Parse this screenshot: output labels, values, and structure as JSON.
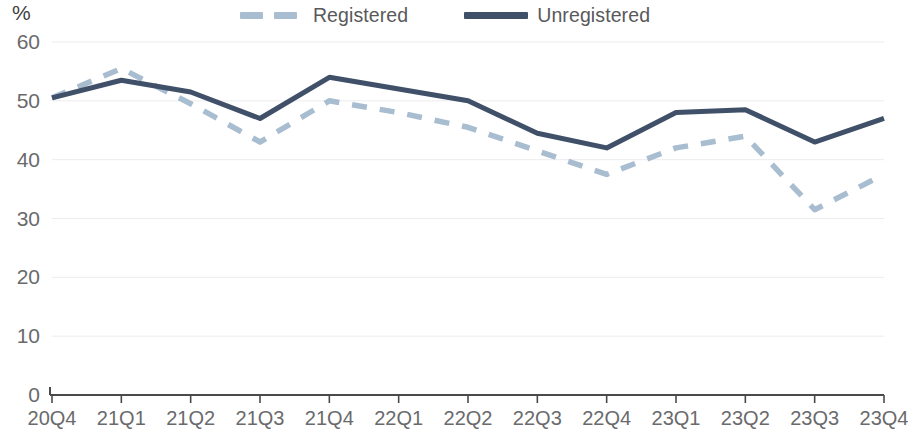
{
  "legend": {
    "entries": [
      {
        "label": "Registered",
        "style": "dashed",
        "color": "#a8bdd0"
      },
      {
        "label": "Unregistered",
        "style": "solid",
        "color": "#3f5068"
      }
    ]
  },
  "axes": {
    "y_unit": "%",
    "y_ticks": [
      "0",
      "10",
      "20",
      "30",
      "40",
      "50",
      "60"
    ]
  },
  "chart_data": {
    "type": "line",
    "title": "",
    "subtitle": "",
    "xlabel": "",
    "ylabel": "%",
    "ylim": [
      0,
      60
    ],
    "ytick_step": 10,
    "grid": true,
    "legend_position": "top-center",
    "categories": [
      "20Q4",
      "21Q1",
      "21Q2",
      "21Q3",
      "21Q4",
      "22Q1",
      "22Q2",
      "22Q3",
      "22Q4",
      "23Q1",
      "23Q2",
      "23Q3",
      "23Q4"
    ],
    "series": [
      {
        "name": "Registered",
        "style": "dashed",
        "color": "#a8bdd0",
        "values": [
          50.5,
          55.5,
          49.5,
          43.0,
          50.0,
          48.0,
          45.5,
          41.5,
          37.5,
          42.0,
          44.0,
          31.5,
          37.5
        ]
      },
      {
        "name": "Unregistered",
        "style": "solid",
        "color": "#3f5068",
        "values": [
          50.5,
          53.5,
          51.5,
          47.0,
          54.0,
          52.0,
          50.0,
          44.5,
          42.0,
          48.0,
          48.5,
          43.0,
          47.0
        ]
      }
    ]
  }
}
